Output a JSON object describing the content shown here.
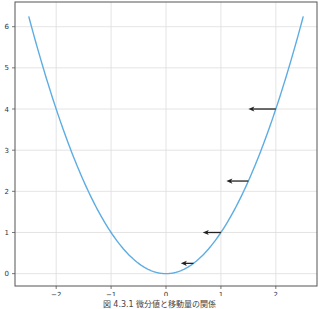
{
  "chart_data": {
    "type": "line",
    "title": "",
    "xlabel": "",
    "ylabel": "",
    "xlim": [
      -2.75,
      2.75
    ],
    "ylim": [
      -0.3,
      6.6
    ],
    "grid": true,
    "xticks": [
      -2,
      -1,
      0,
      1,
      2
    ],
    "xtick_labels": [
      "−2",
      "−1",
      "0",
      "1",
      "2"
    ],
    "yticks": [
      0,
      1,
      2,
      3,
      4,
      5,
      6
    ],
    "ytick_labels": [
      "0",
      "1",
      "2",
      "3",
      "4",
      "5",
      "6"
    ],
    "series": [
      {
        "name": "y = x^2",
        "function": "x^2",
        "x_range": [
          -2.5,
          2.5
        ],
        "color": "#5DADE2"
      }
    ],
    "annotations": [
      {
        "type": "arrow",
        "from": [
          2.0,
          4.0
        ],
        "to": [
          1.5,
          4.0
        ],
        "color": "#222222"
      },
      {
        "type": "arrow",
        "from": [
          1.5,
          2.25
        ],
        "to": [
          1.1,
          2.25
        ],
        "color": "#222222"
      },
      {
        "type": "arrow",
        "from": [
          1.0,
          1.0
        ],
        "to": [
          0.67,
          1.0
        ],
        "color": "#222222"
      },
      {
        "type": "arrow",
        "from": [
          0.5,
          0.25
        ],
        "to": [
          0.27,
          0.25
        ],
        "color": "#222222"
      }
    ],
    "caption": "図 4.3.1 微分値と移動量の関係"
  },
  "colors": {
    "curve": "#5DADE2",
    "arrow": "#222222",
    "grid": "#dddddd",
    "axis": "#555555"
  }
}
